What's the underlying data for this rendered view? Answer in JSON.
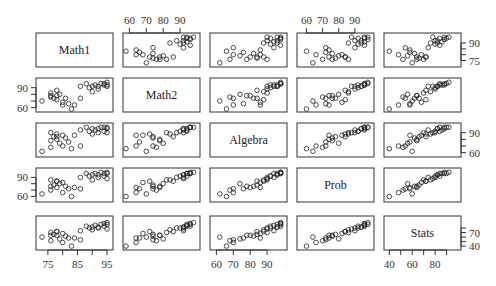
{
  "chart_data": {
    "type": "scatter",
    "subtype": "pairs-matrix",
    "title": "",
    "variables": [
      "Math1",
      "Math2",
      "Algebra",
      "Prob",
      "Stats"
    ],
    "ranges": {
      "Math1": [
        72,
        96
      ],
      "Math2": [
        58,
        100
      ],
      "Algebra": [
        58,
        100
      ],
      "Prob": [
        56,
        100
      ],
      "Stats": [
        38,
        100
      ]
    },
    "axes": {
      "top": [
        {
          "column": 1,
          "variable": "Math2",
          "ticks": [
            60,
            70,
            80,
            90
          ]
        },
        {
          "column": 3,
          "variable": "Prob",
          "ticks": [
            60,
            70,
            80,
            90
          ]
        }
      ],
      "bottom": [
        {
          "column": 0,
          "variable": "Math1",
          "ticks": [
            75,
            85,
            95
          ],
          "minor": [
            80,
            90
          ]
        },
        {
          "column": 2,
          "variable": "Algebra",
          "ticks": [
            60,
            70,
            80,
            90
          ]
        },
        {
          "column": 4,
          "variable": "Stats",
          "ticks": [
            40,
            60,
            80
          ],
          "minor": [
            50,
            70,
            90
          ]
        }
      ],
      "left": [
        {
          "row": 1,
          "variable": "Math2",
          "ticks": [
            60,
            90
          ],
          "minor": [
            70,
            80
          ]
        },
        {
          "row": 3,
          "variable": "Prob",
          "ticks": [
            60,
            90
          ],
          "minor": [
            70,
            80
          ]
        }
      ],
      "right": [
        {
          "row": 0,
          "variable": "Math1",
          "ticks": [
            75,
            90
          ],
          "minor": [
            80,
            85
          ]
        },
        {
          "row": 2,
          "variable": "Algebra",
          "ticks": [
            60,
            90
          ],
          "minor": [
            70,
            80
          ]
        },
        {
          "row": 4,
          "variable": "Stats",
          "ticks": [
            40,
            70
          ],
          "minor": [
            50,
            60,
            80
          ]
        }
      ]
    },
    "observations": {
      "Math1": [
        73,
        76,
        76,
        77,
        78,
        78,
        79,
        80,
        80,
        81,
        82,
        83,
        84,
        86,
        88,
        89,
        90,
        90,
        91,
        92,
        93,
        94,
        94,
        95,
        95,
        95,
        76,
        78,
        86,
        92
      ],
      "Math2": [
        70,
        76,
        82,
        74,
        78,
        72,
        80,
        68,
        64,
        74,
        66,
        58,
        64,
        92,
        96,
        90,
        84,
        92,
        94,
        92,
        96,
        96,
        94,
        94,
        98,
        92,
        78,
        86,
        74,
        88
      ],
      "Algebra": [
        62,
        68,
        90,
        84,
        80,
        88,
        74,
        86,
        70,
        82,
        76,
        66,
        86,
        94,
        98,
        92,
        88,
        96,
        94,
        96,
        98,
        98,
        92,
        96,
        98,
        90,
        78,
        84,
        70,
        90
      ],
      "Prob": [
        64,
        70,
        86,
        78,
        74,
        84,
        80,
        82,
        66,
        76,
        72,
        60,
        74,
        90,
        96,
        92,
        86,
        94,
        96,
        94,
        98,
        96,
        92,
        96,
        98,
        88,
        76,
        84,
        72,
        90
      ],
      "Stats": [
        60,
        52,
        70,
        66,
        64,
        72,
        56,
        68,
        48,
        62,
        58,
        40,
        58,
        74,
        84,
        80,
        76,
        82,
        86,
        82,
        88,
        90,
        84,
        88,
        92,
        78,
        64,
        72,
        54,
        80
      ]
    },
    "xlabel": "",
    "ylabel": "",
    "grid": false,
    "legend": null
  },
  "layout": {
    "cols_x": [
      36,
      123,
      210,
      297,
      384
    ],
    "rows_y": [
      33,
      78,
      123,
      168,
      216
    ],
    "panel_w": 77,
    "panel_h": 34
  }
}
